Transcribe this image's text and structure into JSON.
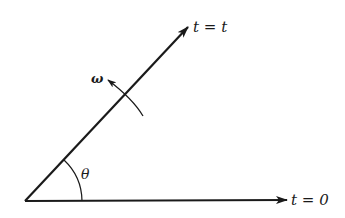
{
  "diagram": {
    "title": "",
    "colors": {
      "stroke": "#1a1a1a",
      "background": "#ffffff"
    },
    "labels": {
      "rotated_axis": "t = t",
      "reference_axis": "t = 0",
      "angular_velocity": "ω",
      "angle": "θ"
    },
    "elements": [
      {
        "type": "arrow",
        "name": "reference-axis",
        "from": [
          25,
          201
        ],
        "to": [
          287,
          200
        ],
        "label": "t = 0"
      },
      {
        "type": "arrow",
        "name": "rotated-axis",
        "from": [
          25,
          201
        ],
        "to": [
          188,
          27
        ],
        "label": "t = t"
      },
      {
        "type": "arc-arrow",
        "name": "rotation-arrow",
        "label": "ω",
        "direction": "counterclockwise"
      },
      {
        "type": "arc",
        "name": "angle-arc",
        "label": "θ"
      }
    ]
  }
}
